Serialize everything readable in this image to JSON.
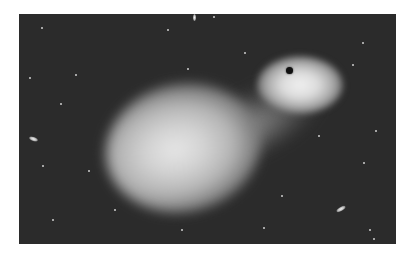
{
  "image": {
    "description": "Grayscale illustration of a black hole accreting matter from a large glowing companion star against a starfield",
    "background_color": "#2b2b2b",
    "frame_color": "#ffffff",
    "elements": {
      "companion_star": "large diffuse glowing star",
      "accretion_stream": "faint stream of gas flowing from star to black hole",
      "accretion_disk": "bright halo around black hole",
      "black_hole": "small dark central point"
    },
    "stars": [
      {
        "x": 22,
        "y": 13
      },
      {
        "x": 56,
        "y": 60
      },
      {
        "x": 41,
        "y": 89
      },
      {
        "x": 168,
        "y": 54
      },
      {
        "x": 148,
        "y": 15
      },
      {
        "x": 225,
        "y": 38
      },
      {
        "x": 194,
        "y": 2
      },
      {
        "x": 343,
        "y": 28
      },
      {
        "x": 333,
        "y": 50
      },
      {
        "x": 356,
        "y": 116
      },
      {
        "x": 299,
        "y": 121
      },
      {
        "x": 344,
        "y": 148
      },
      {
        "x": 23,
        "y": 151
      },
      {
        "x": 69,
        "y": 156
      },
      {
        "x": 95,
        "y": 195
      },
      {
        "x": 33,
        "y": 205
      },
      {
        "x": 262,
        "y": 181
      },
      {
        "x": 244,
        "y": 213
      },
      {
        "x": 162,
        "y": 215
      },
      {
        "x": 354,
        "y": 224
      },
      {
        "x": 350,
        "y": 215
      },
      {
        "x": 10,
        "y": 63
      }
    ],
    "galaxies": [
      {
        "x": 10,
        "y": 123,
        "w": 9,
        "h": 4,
        "rot": 20
      },
      {
        "x": 317,
        "y": 193,
        "w": 10,
        "h": 4,
        "rot": -30
      },
      {
        "x": 174,
        "y": 0,
        "w": 3,
        "h": 7,
        "rot": 0
      }
    ]
  }
}
